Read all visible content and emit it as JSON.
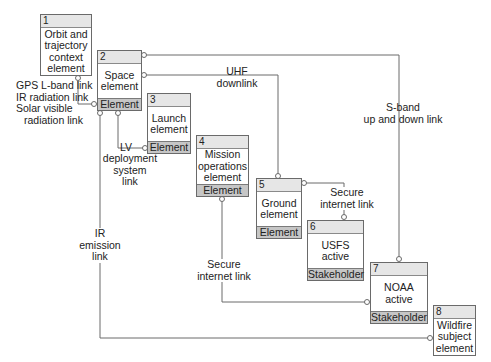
{
  "diagram": {
    "type": "element-interface block diagram",
    "colors": {
      "line": "#6a6a6a",
      "header": "#e6e6e6",
      "footer": "#c6c6c6",
      "background": "#ffffff"
    }
  },
  "elements": [
    {
      "id": "1",
      "name": "Orbit and trajectory context element",
      "lines": [
        "Orbit and",
        "trajectory",
        "context",
        "element"
      ],
      "stereotype": ""
    },
    {
      "id": "2",
      "name": "Space element",
      "lines": [
        "Space",
        "element"
      ],
      "stereotype": "Element"
    },
    {
      "id": "3",
      "name": "Launch element",
      "lines": [
        "Launch",
        "element"
      ],
      "stereotype": "Element"
    },
    {
      "id": "4",
      "name": "Mission operations element",
      "lines": [
        "Mission",
        "operations",
        "element"
      ],
      "stereotype": "Element"
    },
    {
      "id": "5",
      "name": "Ground element",
      "lines": [
        "Ground",
        "element"
      ],
      "stereotype": "Element"
    },
    {
      "id": "6",
      "name": "USFS active",
      "lines": [
        "USFS",
        "active"
      ],
      "stereotype": "Stakeholder"
    },
    {
      "id": "7",
      "name": "NOAA active",
      "lines": [
        "NOAA",
        "active"
      ],
      "stereotype": "Stakeholder"
    },
    {
      "id": "8",
      "name": "Wildfire subject element",
      "lines": [
        "Wildfire",
        "subject",
        "element"
      ],
      "stereotype": ""
    }
  ],
  "links": [
    {
      "from": "1",
      "to": "2",
      "lines": [
        "GPS L-band link",
        "IR radiation link",
        "Solar visible",
        "  radiation link"
      ]
    },
    {
      "from": "2",
      "to": "5",
      "lines": [
        "UHF",
        "downlink"
      ]
    },
    {
      "from": "2",
      "to": "7",
      "lines": [
        "S-band",
        "up and down link"
      ]
    },
    {
      "from": "2",
      "to": "3",
      "lines": [
        "LV",
        "deployment",
        "system",
        "link"
      ]
    },
    {
      "from": "5",
      "to": "6",
      "lines": [
        "Secure",
        "internet link"
      ]
    },
    {
      "from": "4",
      "to": "7",
      "lines": [
        "Secure",
        "internet link"
      ]
    },
    {
      "from": "2",
      "to": "8",
      "lines": [
        "IR",
        "emission",
        "link"
      ]
    }
  ]
}
